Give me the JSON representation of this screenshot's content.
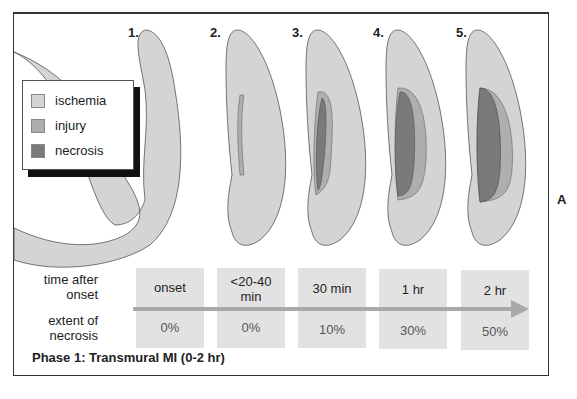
{
  "figure": {
    "panel_letter": "A",
    "caption": "Phase 1: Transmural MI (0-2 hr)",
    "colors": {
      "ischemia": "#d4d4d4",
      "injury": "#aeaeae",
      "necrosis": "#7a7a7a",
      "cell_bg": "#e2e2e2",
      "arrow": "#a9a9a9"
    }
  },
  "legend": {
    "items": [
      {
        "label": "ischemia",
        "color": "#d4d4d4"
      },
      {
        "label": "injury",
        "color": "#aeaeae"
      },
      {
        "label": "necrosis",
        "color": "#7a7a7a"
      }
    ]
  },
  "stages": [
    {
      "number": "1.",
      "time": "onset",
      "time_line2": "",
      "extent": "0%"
    },
    {
      "number": "2.",
      "time": "<20-40",
      "time_line2": "min",
      "extent": "0%"
    },
    {
      "number": "3.",
      "time": "30 min",
      "time_line2": "",
      "extent": "10%"
    },
    {
      "number": "4.",
      "time": "1 hr",
      "time_line2": "",
      "extent": "30%"
    },
    {
      "number": "5.",
      "time": "2 hr",
      "time_line2": "",
      "extent": "50%"
    }
  ],
  "table": {
    "row1_label_line1": "time after",
    "row1_label_line2": "onset",
    "row2_label_line1": "extent of",
    "row2_label_line2": "necrosis"
  }
}
